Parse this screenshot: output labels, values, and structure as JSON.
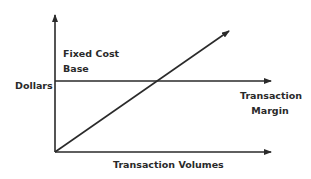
{
  "diagram": {
    "type": "cost-volume diagram",
    "y_axis_label": "Dollars",
    "x_axis_label": "Transaction Volumes",
    "fixed_cost_label": [
      "Fixed Cost",
      "Base"
    ],
    "margin_label": [
      "Transaction",
      "Margin"
    ],
    "line_color": "#2a2a2a",
    "text_color": "#2a2a2a"
  }
}
